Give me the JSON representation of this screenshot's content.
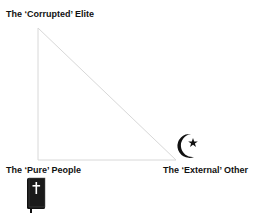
{
  "diagram": {
    "vertices": {
      "top": {
        "label": "The ‘Corrupted’ Elite"
      },
      "bottom_left": {
        "label": "The ‘Pure’ People",
        "icon": "bible-cross-icon"
      },
      "bottom_right": {
        "label": "The ‘External’ Other",
        "icon": "crescent-star-icon"
      }
    },
    "line_color": "#d8d8d8",
    "text_color": "#111111"
  }
}
